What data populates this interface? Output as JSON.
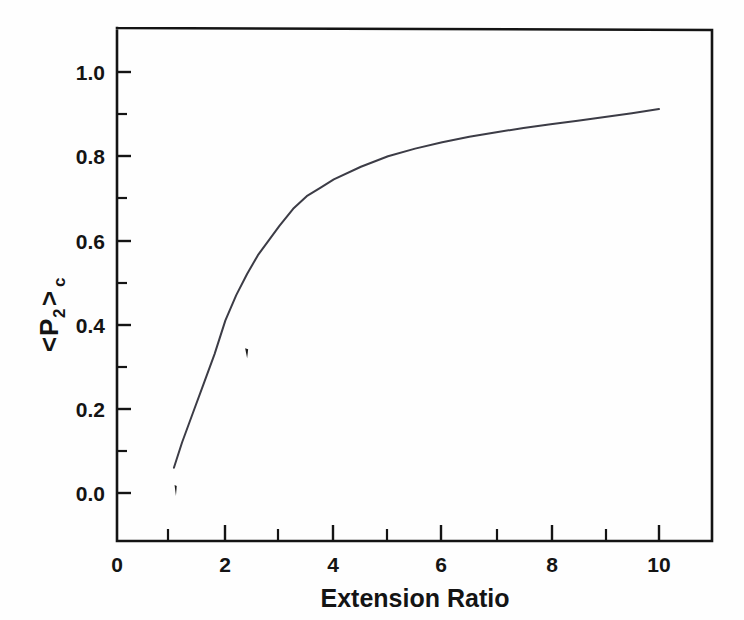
{
  "chart_data": {
    "type": "line",
    "title": "",
    "xlabel": "Extension Ratio",
    "ylabel": "<P2>c",
    "ylabel_parts": {
      "open_bracket": "<",
      "symbol": "P",
      "subscript": "2",
      "close_bracket": ">",
      "outer_subscript": "c"
    },
    "xlim": [
      0,
      11
    ],
    "ylim": [
      -0.07,
      1.12
    ],
    "grid": false,
    "legend": null,
    "x_major_ticks": [
      0,
      2,
      4,
      6,
      8,
      10
    ],
    "x_major_tick_labels": [
      "0",
      "2",
      "4",
      "6",
      "8",
      "10"
    ],
    "x_minor_ticks": [
      1,
      3,
      5,
      7,
      9
    ],
    "y_major_ticks": [
      0.0,
      0.2,
      0.4,
      0.6,
      0.8,
      1.0
    ],
    "y_major_tick_labels": [
      "0.0",
      "0.2",
      "0.4",
      "0.6",
      "0.8",
      "1.0"
    ],
    "y_minor_ticks": [
      0.1,
      0.3,
      0.5,
      0.7,
      0.9,
      1.1
    ],
    "line_color": "#3c3c46",
    "axis_color": "#141414",
    "background_color": "#fefefe",
    "series": [
      {
        "name": "order parameter",
        "x": [
          1.05,
          1.2,
          1.4,
          1.6,
          1.8,
          2.0,
          2.2,
          2.4,
          2.6,
          2.8,
          3.0,
          3.25,
          3.5,
          3.75,
          4.0,
          4.5,
          5.0,
          5.5,
          6.0,
          6.5,
          7.0,
          7.5,
          8.0,
          8.5,
          9.0,
          9.5,
          10.0
        ],
        "y": [
          0.06,
          0.12,
          0.19,
          0.26,
          0.33,
          0.41,
          0.47,
          0.52,
          0.565,
          0.6,
          0.635,
          0.675,
          0.705,
          0.725,
          0.745,
          0.775,
          0.8,
          0.818,
          0.833,
          0.846,
          0.857,
          0.867,
          0.876,
          0.884,
          0.893,
          0.902,
          0.912
        ]
      }
    ],
    "artifacts": [
      {
        "name": "stray-scan-mark",
        "x": 2.39,
        "y": 0.332
      },
      {
        "name": "curve-start-fragment",
        "x": 1.08,
        "y": 0.005
      }
    ]
  }
}
